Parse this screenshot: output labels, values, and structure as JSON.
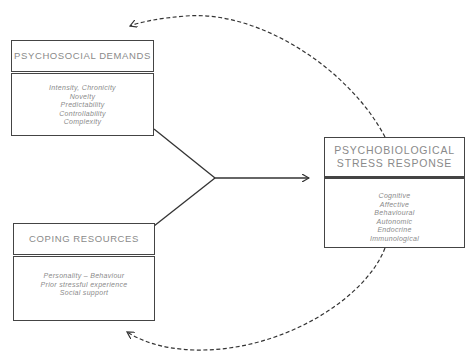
{
  "demands": {
    "title": "PSYCHOSOCIAL DEMANDS",
    "items": [
      "Intensity, Chronicity",
      "Novelty",
      "Predictability",
      "Controllability",
      "Complexity"
    ]
  },
  "coping": {
    "title": "COPING RESOURCES",
    "items": [
      "Personality – Behaviour",
      "Prior stressful experience",
      "Social support"
    ]
  },
  "response": {
    "title_line1": "PSYCHOBIOLOGICAL",
    "title_line2": "STRESS RESPONSE",
    "items": [
      "Cognitive",
      "Affective",
      "Behavioural",
      "Autonomic",
      "Endocrine",
      "Immunological"
    ]
  },
  "colors": {
    "line": "#333333",
    "text": "#8a8a8a",
    "box_border": "#444444"
  }
}
